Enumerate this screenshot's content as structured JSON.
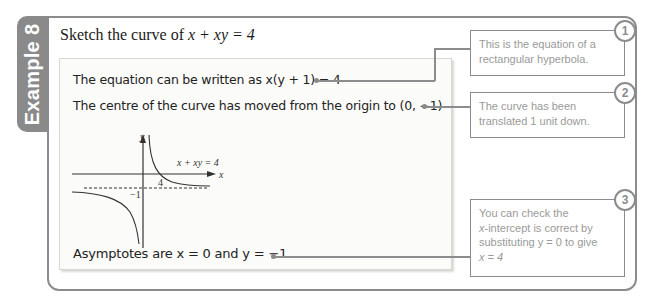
{
  "example_tab": {
    "label": "Example 8"
  },
  "question": {
    "prefix": "Sketch the curve of ",
    "equation": "x + xy = 4"
  },
  "working": {
    "step1": "The equation can be written as x(y + 1) = 4",
    "step2": "The centre of the curve has moved from the origin to (0, −1)",
    "step3": "Asymptotes are x = 0 and y = −1"
  },
  "graph": {
    "y_axis_label": "y",
    "x_axis_label": "x",
    "curve_label": "x + xy = 4",
    "x_intercept_label": "4",
    "asymptote_label": "−1"
  },
  "callouts": [
    {
      "number": "1",
      "line1": "This is the equation of a",
      "line2": "rectangular hyperbola."
    },
    {
      "number": "2",
      "line1": "The curve has been",
      "line2": "translated 1 unit down."
    },
    {
      "number": "3",
      "line1": "You can check the",
      "line2_em": "x",
      "line2_rest": "-intercept is correct by",
      "line3": "substituting y = 0 to give",
      "line4": "x = 4"
    }
  ],
  "colors": {
    "frame": "#8c8c8c",
    "tab": "#8a8a8a",
    "callout_text": "#9a9a9a"
  }
}
